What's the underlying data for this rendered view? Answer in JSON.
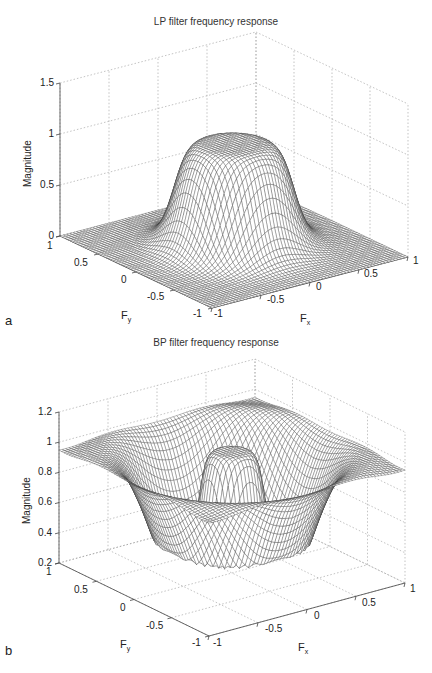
{
  "chart_data": [
    {
      "type": "surface",
      "panel_label": "a",
      "title": "LP filter frequency response",
      "xlabel": "F_x",
      "ylabel": "F_y",
      "zlabel": "Magnitude",
      "xlim": [
        -1,
        1
      ],
      "ylim": [
        -1,
        1
      ],
      "zlim": [
        0,
        1.5
      ],
      "x_ticks": [
        "-1",
        "-0.5",
        "0",
        "0.5",
        "1"
      ],
      "y_ticks": [
        "-1",
        "-0.5",
        "0",
        "0.5",
        "1"
      ],
      "z_ticks": [
        "0",
        "0.5",
        "1",
        "1.5"
      ],
      "grid": true,
      "description": "Circularly symmetric low-pass: magnitude ~1 for radius < ~0.35, smooth roll-off to ~0 beyond radius ~0.6",
      "passband_magnitude": 1.0,
      "stopband_magnitude": 0.0,
      "cutoff_radius": 0.45
    },
    {
      "type": "surface",
      "panel_label": "b",
      "title": "BP filter frequency response",
      "xlabel": "F_x",
      "ylabel": "F_y",
      "zlabel": "Magnitude",
      "xlim": [
        -1,
        1
      ],
      "ylim": [
        -1,
        1
      ],
      "zlim": [
        0.2,
        1.2
      ],
      "x_ticks": [
        "-1",
        "-0.5",
        "0",
        "0.5",
        "1"
      ],
      "y_ticks": [
        "-1",
        "-0.5",
        "0",
        "0.5",
        "1"
      ],
      "z_ticks": [
        "0.2",
        "0.4",
        "0.6",
        "0.8",
        "1",
        "1.2"
      ],
      "grid": true,
      "description": "Band response: ~1 at center (radius < ~0.2), dips to ~0.25 in an annulus (radius ~0.45-0.6) with ripple, returns to ~1 near edges",
      "center_magnitude": 1.0,
      "min_magnitude": 0.25,
      "edge_magnitude": 1.0
    }
  ],
  "panels": {
    "a": {
      "label": "a",
      "title": "LP filter frequency response",
      "zlabel": "Magnitude",
      "z_ticks": [
        "1.5",
        "1",
        "0.5",
        "0"
      ],
      "y_ticks": [
        "1",
        "0.5",
        "0",
        "-0.5",
        "-1"
      ],
      "x_ticks": [
        "-1",
        "-0.5",
        "0",
        "0.5",
        "1"
      ],
      "fx_main": "F",
      "fx_sub": "x",
      "fy_main": "F",
      "fy_sub": "y"
    },
    "b": {
      "label": "b",
      "title": "BP filter frequency response",
      "zlabel": "Magnitude",
      "z_ticks": [
        "1.2",
        "1",
        "0.8",
        "0.6",
        "0.4",
        "0.2"
      ],
      "y_ticks": [
        "1",
        "0.5",
        "0",
        "-0.5",
        "-1"
      ],
      "x_ticks": [
        "-1",
        "-0.5",
        "0",
        "0.5",
        "1"
      ],
      "fx_main": "F",
      "fx_sub": "x",
      "fy_main": "F",
      "fy_sub": "y"
    }
  },
  "style": {
    "mesh_color": "#3a3a3a",
    "grid_color": "#9a9a9a",
    "axis_color": "#444444",
    "background": "#ffffff"
  }
}
